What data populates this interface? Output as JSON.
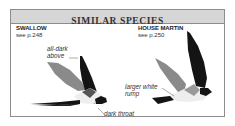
{
  "header": {
    "title": "SIMILAR SPECIES"
  },
  "species": [
    {
      "name": "SWALLOW",
      "ref": "see p.248",
      "annotations": [
        "all-dark above",
        "dark throat"
      ]
    },
    {
      "name": "HOUSE MARTIN",
      "ref": "see p.250",
      "annotations": [
        "larger white rump"
      ]
    }
  ],
  "annotations": {
    "swallow_1a": "all-dark",
    "swallow_1b": "above",
    "swallow_2": "dark throat",
    "martin_1a": "larger white",
    "martin_1b": "rump"
  },
  "colors": {
    "header_bg": "#d6d6d6",
    "border": "#8c8c8c",
    "bird_dark": "#141414",
    "wing_gray": "#8a8a8a"
  }
}
